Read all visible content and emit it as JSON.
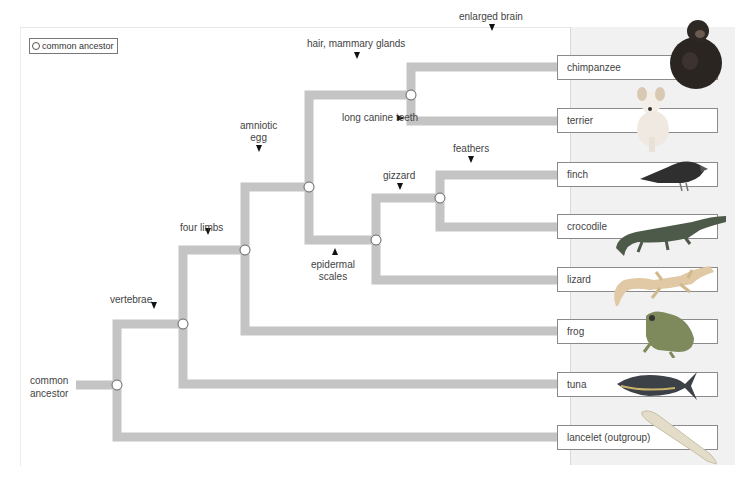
{
  "legend": {
    "label": "common ancestor",
    "icon": "open-circle-node"
  },
  "root": {
    "label_line1": "common",
    "label_line2": "ancestor"
  },
  "traits": {
    "vertebrae": "vertebrae",
    "four_limbs": "four limbs",
    "amniotic_egg_line1": "amniotic",
    "amniotic_egg_line2": "egg",
    "hair": "hair, mammary glands",
    "enlarged_brain": "enlarged brain",
    "long_canine": "long canine teeth",
    "epidermal_line1": "epidermal",
    "epidermal_line2": "scales",
    "gizzard": "gizzard",
    "feathers": "feathers"
  },
  "taxa": [
    {
      "label": "chimpanzee",
      "icon": "chimpanzee-image"
    },
    {
      "label": "terrier",
      "icon": "dog-image"
    },
    {
      "label": "finch",
      "icon": "bird-image"
    },
    {
      "label": "crocodile",
      "icon": "crocodile-image"
    },
    {
      "label": "lizard",
      "icon": "lizard-image"
    },
    {
      "label": "frog",
      "icon": "frog-image"
    },
    {
      "label": "tuna",
      "icon": "fish-image"
    },
    {
      "label": "lancelet (outgroup)",
      "icon": "lancelet-image"
    }
  ],
  "colors": {
    "branch": "#c4c4c4",
    "node_fill": "#ffffff",
    "node_stroke": "#666666",
    "band": "#f1f1f1"
  }
}
